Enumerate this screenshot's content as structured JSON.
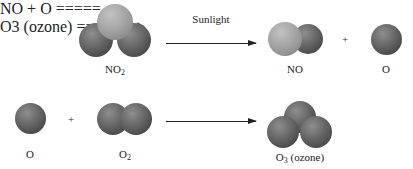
{
  "reaction_1": {
    "reactant": {
      "formula_base": "NO",
      "formula_sub": "2"
    },
    "arrow_label": "Sunlight",
    "products": [
      {
        "formula_base": "NO",
        "formula_sub": ""
      },
      {
        "formula_base": "O",
        "formula_sub": ""
      }
    ],
    "plus": "+"
  },
  "reaction_2": {
    "reactants": [
      {
        "formula_base": "O",
        "formula_sub": ""
      },
      {
        "formula_base": "O",
        "formula_sub": "2"
      }
    ],
    "plus": "+",
    "product": {
      "formula_base": "O",
      "formula_sub": "3",
      "note": "(ozone)"
    }
  },
  "colors": {
    "oxygen_atom": "#5a5a5a",
    "nitrogen_atom": "#a6a6a6",
    "arrow": "#222222",
    "text": "#222222"
  }
}
